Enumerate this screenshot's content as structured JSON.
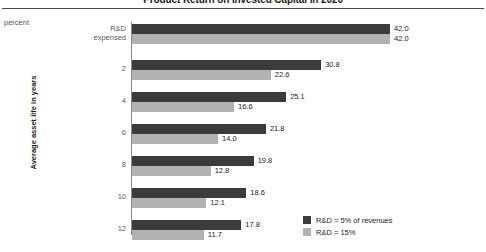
{
  "header": {
    "title": "Product Return on Invested Capital in 2020",
    "unit_label": "percent"
  },
  "legend": {
    "items": [
      {
        "label": "R&D = 5% of revenues",
        "color": "#3b3b3b"
      },
      {
        "label": "R&D = 15%",
        "color": "#b2b2b2"
      }
    ]
  },
  "chart_data": {
    "type": "bar",
    "orientation": "horizontal",
    "title": "Product Return on Invested Capital in 2020",
    "xlabel": "percent",
    "ylabel": "Average asset life in years",
    "categories": [
      "R&D\nexpensed",
      "2",
      "4",
      "6",
      "8",
      "10",
      "12"
    ],
    "category_labels": [
      {
        "line1": "R&D",
        "line2": "expensed"
      },
      {
        "line1": "2",
        "line2": ""
      },
      {
        "line1": "4",
        "line2": ""
      },
      {
        "line1": "6",
        "line2": ""
      },
      {
        "line1": "8",
        "line2": ""
      },
      {
        "line1": "10",
        "line2": ""
      },
      {
        "line1": "12",
        "line2": ""
      }
    ],
    "series": [
      {
        "name": "R&D = 5% of revenues",
        "color": "#3b3b3b",
        "values": [
          42.0,
          30.8,
          25.1,
          21.8,
          19.8,
          18.6,
          17.8
        ],
        "labels": [
          "42.0",
          "30.8",
          "25.1",
          "21.8",
          "19.8",
          "18.6",
          "17.8"
        ]
      },
      {
        "name": "R&D = 15%",
        "color": "#b2b2b2",
        "values": [
          42.0,
          22.6,
          16.6,
          14.0,
          12.8,
          12.1,
          11.7
        ],
        "labels": [
          "42.0",
          "22.6",
          "16.6",
          "14.0",
          "12.8",
          "12.1",
          "11.7"
        ]
      }
    ],
    "xlim": [
      0,
      42.0
    ],
    "grid": false,
    "legend_position": "bottom-right"
  }
}
